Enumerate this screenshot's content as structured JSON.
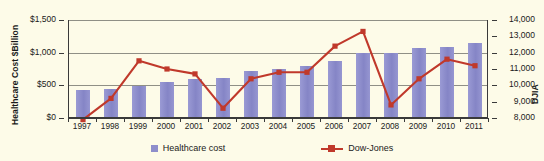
{
  "chart_data": {
    "type": "bar",
    "title": "",
    "categories": [
      "1997",
      "1998",
      "1999",
      "2000",
      "2001",
      "2002",
      "2003",
      "2004",
      "2005",
      "2006",
      "2007",
      "2008",
      "2009",
      "2010",
      "2011"
    ],
    "xlabel": "",
    "grid": true,
    "legend_position": "bottom",
    "series": [
      {
        "name": "Healthcare cost",
        "type": "bar",
        "axis": "left",
        "ylabel": "Healthcare Cost $Billion",
        "ylim": [
          0,
          1500
        ],
        "yticks": [
          0,
          500,
          1000,
          1500
        ],
        "ytick_labels": [
          "$0",
          "$500",
          "$1,000",
          "$1,500"
        ],
        "color": "#8e8ecb",
        "values": [
          430,
          440,
          495,
          545,
          600,
          620,
          720,
          755,
          790,
          870,
          990,
          1000,
          1070,
          1090,
          1150
        ]
      },
      {
        "name": "Dow-Jones",
        "type": "line",
        "axis": "right",
        "ylabel": "DJIA",
        "ylim": [
          8000,
          14000
        ],
        "yticks": [
          8000,
          9000,
          10000,
          11000,
          12000,
          13000,
          14000
        ],
        "ytick_labels": [
          "8,000",
          "9,000",
          "10,000",
          "11,000",
          "12,000",
          "13,000",
          "14,000"
        ],
        "color": "#c0392b",
        "values": [
          7900,
          9200,
          11500,
          11000,
          10700,
          8600,
          10400,
          10800,
          10800,
          12400,
          13300,
          8800,
          10400,
          11600,
          11200
        ]
      }
    ]
  },
  "axes": {
    "left_title": "Healthcare Cost $Billion",
    "right_title": "DJIA"
  },
  "legend": {
    "items": [
      {
        "label": "Healthcare cost",
        "marker": "square-swatch",
        "color": "#8e8ecb"
      },
      {
        "label": "Dow-Jones",
        "marker": "line-with-square-marker",
        "color": "#c0392b"
      }
    ]
  }
}
